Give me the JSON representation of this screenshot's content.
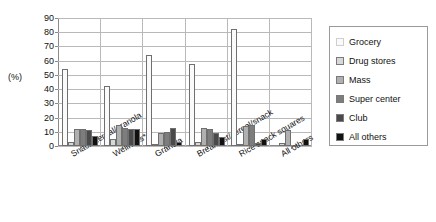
{
  "chart_data": {
    "type": "bar",
    "title": "",
    "xlabel": "",
    "ylabel": "(%)",
    "ylim": [
      0,
      90
    ],
    "yticks": [
      0,
      10,
      20,
      30,
      40,
      50,
      60,
      70,
      80,
      90
    ],
    "grid": true,
    "legend_position": "right",
    "categories": [
      "Snack/cereal/granola",
      "Wellness*",
      "Granola",
      "Breakfast/cereal/snack",
      "Rice snack squares",
      "All others"
    ],
    "series": [
      {
        "name": "Grocery",
        "color": "#fafafa",
        "values": [
          54,
          42,
          64,
          58,
          82,
          0
        ]
      },
      {
        "name": "Drug stores",
        "color": "#d8d8d8",
        "values": [
          3,
          5,
          1,
          3,
          1,
          2
        ]
      },
      {
        "name": "Mass",
        "color": "#b0b0b0",
        "values": [
          12,
          15,
          9,
          13,
          14,
          11
        ]
      },
      {
        "name": "Super center",
        "color": "#7d7d7d",
        "values": [
          12,
          13,
          10,
          12,
          15,
          0
        ]
      },
      {
        "name": "Club",
        "color": "#4a4a4a",
        "values": [
          11,
          12,
          13,
          9,
          2,
          0
        ]
      },
      {
        "name": "All others",
        "color": "#111111",
        "values": [
          7,
          12,
          3,
          6,
          5,
          5
        ]
      }
    ]
  },
  "legend": {
    "items": [
      {
        "label": "Grocery"
      },
      {
        "label": "Drug stores"
      },
      {
        "label": "Mass"
      },
      {
        "label": "Super center"
      },
      {
        "label": "Club"
      },
      {
        "label": "All others"
      }
    ]
  }
}
